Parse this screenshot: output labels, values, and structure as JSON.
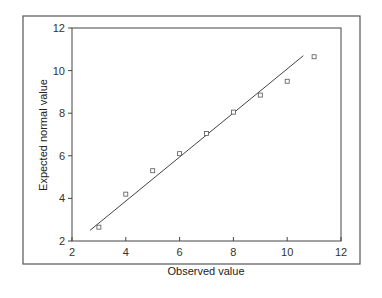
{
  "chart_data": {
    "type": "scatter",
    "title": "",
    "xlabel": "Observed value",
    "ylabel": "Expected normal value",
    "xlim": [
      2,
      12
    ],
    "ylim": [
      2,
      12
    ],
    "xticks": [
      2,
      4,
      6,
      8,
      10,
      12
    ],
    "yticks": [
      2,
      4,
      6,
      8,
      10,
      12
    ],
    "grid": false,
    "legend": null,
    "series": [
      {
        "name": "Observations",
        "marker": "square",
        "x": [
          3,
          4,
          5,
          6,
          7,
          8,
          9,
          10,
          11
        ],
        "y": [
          2.65,
          4.2,
          5.3,
          6.1,
          7.05,
          8.05,
          8.85,
          9.5,
          10.65
        ]
      }
    ],
    "reference_line": {
      "name": "Normal reference line",
      "x": [
        2.67,
        10.6
      ],
      "y": [
        2.5,
        10.7
      ]
    }
  },
  "colors": {
    "frame": "#555555",
    "axis": "#444444",
    "marker": "#555555",
    "line": "#444444"
  }
}
